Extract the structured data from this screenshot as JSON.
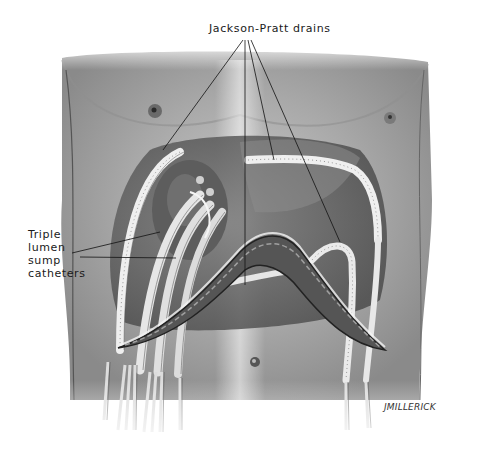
{
  "figure": {
    "labels": {
      "top": "Jackson-Pratt drains",
      "left_lines": [
        "Triple",
        "lumen",
        "sump",
        "catheters"
      ]
    },
    "signature": "JMILLERICK",
    "colors": {
      "background": "#ffffff",
      "skin_light": "#d8d8d8",
      "skin_mid": "#a9a9a9",
      "skin_dark": "#6e6e6e",
      "cavity": "#5a5a5a",
      "tube": "#ededed",
      "leader_line": "#111111"
    }
  }
}
